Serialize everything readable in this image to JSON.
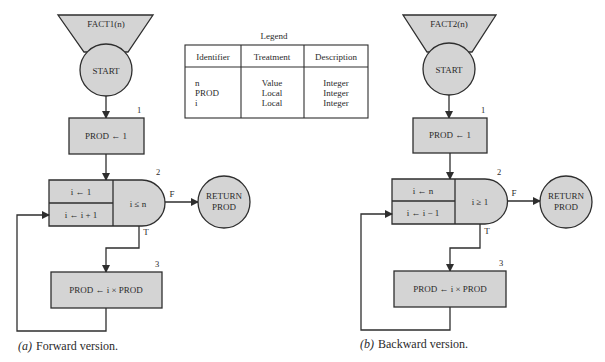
{
  "legend": {
    "title": "Legend",
    "headers": [
      "Identifier",
      "Treatment",
      "Description"
    ],
    "rows": [
      {
        "identifier": "n",
        "treatment": "Value",
        "description": "Integer"
      },
      {
        "identifier": "PROD",
        "treatment": "Local",
        "description": "Integer"
      },
      {
        "identifier": "i",
        "treatment": "Local",
        "description": "Integer"
      }
    ]
  },
  "forward": {
    "name": "FACT1(n)",
    "start": "START",
    "step1_number": "1",
    "step1": "PROD ← 1",
    "step2_number": "2",
    "init": "i ← 1",
    "increment": "i ← i + 1",
    "condition": "i ≤ n",
    "false_label": "F",
    "true_label": "T",
    "return_line1": "RETURN",
    "return_line2": "PROD",
    "step3_number": "3",
    "step3": "PROD ← i × PROD",
    "caption_letter": "(a)",
    "caption": "Forward version."
  },
  "backward": {
    "name": "FACT2(n)",
    "start": "START",
    "step1_number": "1",
    "step1": "PROD ← 1",
    "step2_number": "2",
    "init": "i ← n",
    "increment": "i ← i − 1",
    "condition": "i ≥ 1",
    "false_label": "F",
    "true_label": "T",
    "return_line1": "RETURN",
    "return_line2": "PROD",
    "step3_number": "3",
    "step3": "PROD ← i × PROD",
    "caption_letter": "(b)",
    "caption": "Backward version."
  },
  "colors": {
    "fill": "#d4d4d4",
    "stroke": "#2e2e2e",
    "text": "#2a2a2a"
  }
}
